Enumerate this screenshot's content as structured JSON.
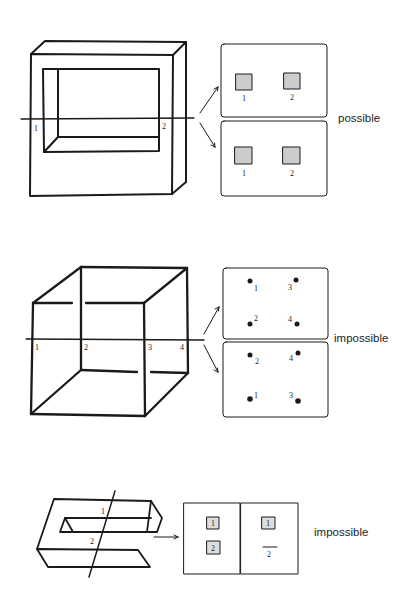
{
  "figures": [
    {
      "id": "frame",
      "object": "rectangular frame (square ring)",
      "intersection_labels": [
        "1",
        "2"
      ],
      "panels": [
        {
          "points": [
            {
              "label": "1",
              "marker": "square"
            },
            {
              "label": "2",
              "marker": "square"
            }
          ]
        },
        {
          "points": [
            {
              "label": "1",
              "marker": "square"
            },
            {
              "label": "2",
              "marker": "square"
            }
          ]
        }
      ],
      "verdict": "possible"
    },
    {
      "id": "cube",
      "object": "wireframe cube with gapped edges",
      "intersection_labels": [
        "1",
        "2",
        "3",
        "4"
      ],
      "panels": [
        {
          "points": [
            {
              "label": "1"
            },
            {
              "label": "3"
            },
            {
              "label": "2"
            },
            {
              "label": "4"
            }
          ]
        },
        {
          "points": [
            {
              "label": "2"
            },
            {
              "label": "4"
            },
            {
              "label": "1"
            },
            {
              "label": "3"
            }
          ]
        }
      ],
      "verdict": "impossible"
    },
    {
      "id": "s-shape",
      "object": "S-shaped bar",
      "intersection_labels": [
        "1",
        "2"
      ],
      "panels": [
        {
          "points": [
            {
              "label": "1",
              "marker": "square"
            },
            {
              "label": "2",
              "marker": "square"
            }
          ]
        },
        {
          "points": [
            {
              "label": "1",
              "marker": "square"
            },
            {
              "label": "2",
              "marker": "line"
            }
          ]
        }
      ],
      "verdict": "impossible"
    }
  ]
}
